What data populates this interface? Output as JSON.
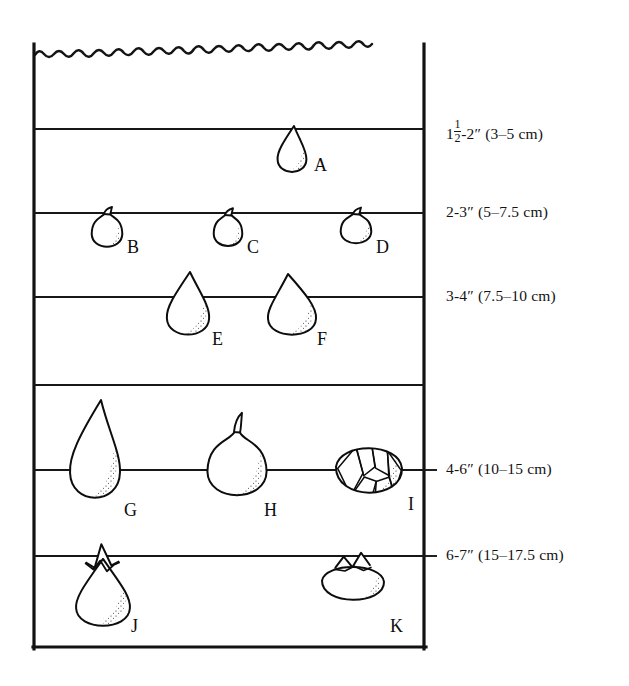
{
  "figure": {
    "kind": "bulb-planting-depth-diagram",
    "soil_surface": "wavy soil surface line",
    "box": {
      "left": 33,
      "right": 425,
      "top": 45,
      "bottom": 648
    }
  },
  "depth_lines": [
    {
      "id": "d1",
      "y": 129,
      "label_whole": "1",
      "label_frac_n": "1",
      "label_frac_d": "2",
      "label_rest": "-2″ (3–5 cm)",
      "has_tick": false
    },
    {
      "id": "d2",
      "y": 213,
      "label_whole": "2-3″ (5–7.5 cm)",
      "label_frac_n": "",
      "label_frac_d": "",
      "label_rest": "",
      "has_tick": false
    },
    {
      "id": "d3",
      "y": 297,
      "label_whole": "3-4″ (7.5–10 cm)",
      "label_frac_n": "",
      "label_frac_d": "",
      "label_rest": "",
      "has_tick": false
    },
    {
      "id": "d4",
      "y": 385,
      "label_whole": "",
      "label_frac_n": "",
      "label_frac_d": "",
      "label_rest": "",
      "has_tick": false
    },
    {
      "id": "d5",
      "y": 470,
      "label_whole": "4-6″ (10–15 cm)",
      "label_frac_n": "",
      "label_frac_d": "",
      "label_rest": "",
      "has_tick": true
    },
    {
      "id": "d6",
      "y": 556,
      "label_whole": "6-7″ (15–17.5 cm)",
      "label_frac_n": "",
      "label_frac_d": "",
      "label_rest": "",
      "has_tick": true
    }
  ],
  "bulbs": [
    {
      "letter": "A",
      "shape": "teardrop",
      "cx": 292,
      "cy": 150,
      "w": 30,
      "h": 48,
      "letter_x": 314,
      "letter_y": 156
    },
    {
      "letter": "B",
      "shape": "round-tip",
      "cx": 107,
      "cy": 231,
      "w": 30,
      "h": 36,
      "letter_x": 127,
      "letter_y": 238
    },
    {
      "letter": "C",
      "shape": "round-tip",
      "cx": 228,
      "cy": 231,
      "w": 28,
      "h": 34,
      "letter_x": 247,
      "letter_y": 238
    },
    {
      "letter": "D",
      "shape": "round-tip",
      "cx": 356,
      "cy": 229,
      "w": 30,
      "h": 32,
      "letter_x": 376,
      "letter_y": 238
    },
    {
      "letter": "E",
      "shape": "teardrop",
      "cx": 188,
      "cy": 305,
      "w": 44,
      "h": 66,
      "letter_x": 212,
      "letter_y": 330
    },
    {
      "letter": "F",
      "shape": "teardrop-wide",
      "cx": 292,
      "cy": 306,
      "w": 50,
      "h": 64,
      "letter_x": 317,
      "letter_y": 330
    },
    {
      "letter": "G",
      "shape": "teardrop-long",
      "cx": 95,
      "cy": 452,
      "w": 52,
      "h": 104,
      "letter_x": 124,
      "letter_y": 501
    },
    {
      "letter": "H",
      "shape": "round-tip-big",
      "cx": 237,
      "cy": 466,
      "w": 58,
      "h": 70,
      "letter_x": 264,
      "letter_y": 501
    },
    {
      "letter": "I",
      "shape": "scaly",
      "cx": 369,
      "cy": 470,
      "w": 66,
      "h": 64,
      "letter_x": 408,
      "letter_y": 495
    },
    {
      "letter": "J",
      "shape": "sprouting",
      "cx": 103,
      "cy": 586,
      "w": 56,
      "h": 82,
      "letter_x": 131,
      "letter_y": 617
    },
    {
      "letter": "K",
      "shape": "corm",
      "cx": 353,
      "cy": 583,
      "w": 62,
      "h": 48,
      "letter_x": 390,
      "letter_y": 617
    }
  ],
  "colors": {
    "ink": "#0d0d0d",
    "line": "#171717",
    "paper": "#ffffff",
    "stipple": "#2a2a2a"
  }
}
